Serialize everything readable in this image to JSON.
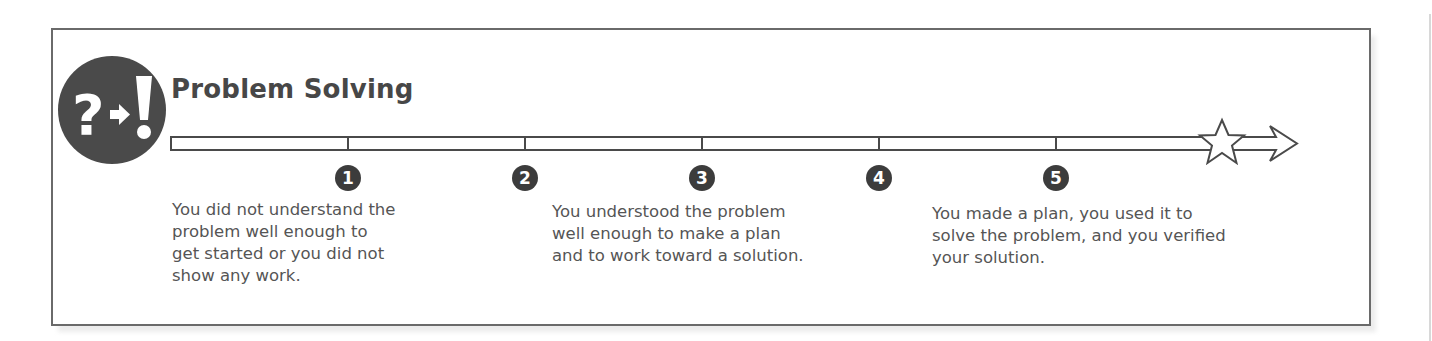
{
  "panel": {
    "title": "Problem Solving",
    "icon": {
      "name": "question-to-exclamation-icon",
      "glyphs": [
        "?",
        "→",
        "!"
      ]
    },
    "colors": {
      "border": "#6a6a6a",
      "icon_bg": "#4a4a4a",
      "title": "#474747",
      "text": "#555555",
      "badge_bg": "#3c3c3c"
    }
  },
  "scale": {
    "steps": [
      {
        "number": "1",
        "x": 348
      },
      {
        "number": "2",
        "x": 525
      },
      {
        "number": "3",
        "x": 702
      },
      {
        "number": "4",
        "x": 879
      },
      {
        "number": "5",
        "x": 1056
      }
    ],
    "end_marker": "star",
    "descriptions": [
      {
        "position": "low",
        "lines": [
          "You did not understand the",
          "problem well enough to",
          "get started or you did not",
          "show any work."
        ]
      },
      {
        "position": "mid",
        "lines": [
          "You understood the problem",
          "well enough to make a plan",
          "and to work toward a solution."
        ]
      },
      {
        "position": "high",
        "lines": [
          "You made a plan, you used it to",
          "solve the problem, and you verified",
          "your solution."
        ]
      }
    ]
  }
}
